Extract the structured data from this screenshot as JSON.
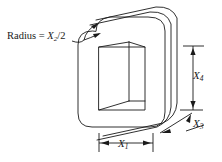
{
  "figure": {
    "background_color": "#ffffff",
    "line_color": "#1a1a1a",
    "labels": {
      "radius": {
        "prefix": "Radius = ",
        "variable": "X",
        "subscript": "2",
        "suffix": "/2",
        "full_text": "Radius = X2/2"
      },
      "height": {
        "variable": "X",
        "subscript": "4",
        "full_text": "X4"
      },
      "depth": {
        "variable": "X",
        "subscript": "3",
        "full_text": "X3"
      },
      "width": {
        "variable": "X",
        "subscript": "1",
        "full_text": "X1"
      }
    },
    "dimensions": [
      {
        "name": "width-dimension",
        "label": "X1",
        "orientation": "horizontal",
        "position": "bottom"
      },
      {
        "name": "corner-radius-callout",
        "label": "Radius = X2/2",
        "orientation": "leader",
        "position": "top-left"
      },
      {
        "name": "depth-dimension",
        "label": "X3",
        "orientation": "diagonal",
        "position": "bottom-right"
      },
      {
        "name": "height-dimension",
        "label": "X4",
        "orientation": "vertical",
        "position": "right"
      }
    ],
    "layers": 3
  }
}
